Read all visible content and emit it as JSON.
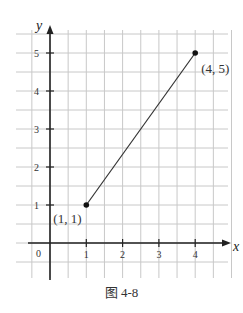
{
  "chart_data": {
    "type": "line",
    "title": "",
    "caption": "图 4-8",
    "xlabel": "x",
    "ylabel": "y",
    "xlim": [
      -0.5,
      4.5
    ],
    "ylim": [
      -1,
      5.5
    ],
    "grid": true,
    "x_ticks": [
      "1",
      "2",
      "3",
      "4"
    ],
    "y_ticks": [
      "1",
      "2",
      "3",
      "4",
      "5"
    ],
    "origin_label": "0",
    "series": [
      {
        "name": "segment",
        "points": [
          {
            "x": 1,
            "y": 1
          },
          {
            "x": 4,
            "y": 5
          }
        ]
      }
    ],
    "annotations": [
      {
        "text": "(1, 1)",
        "x": 1,
        "y": 1
      },
      {
        "text": "(4, 5)",
        "x": 4,
        "y": 5
      }
    ]
  }
}
